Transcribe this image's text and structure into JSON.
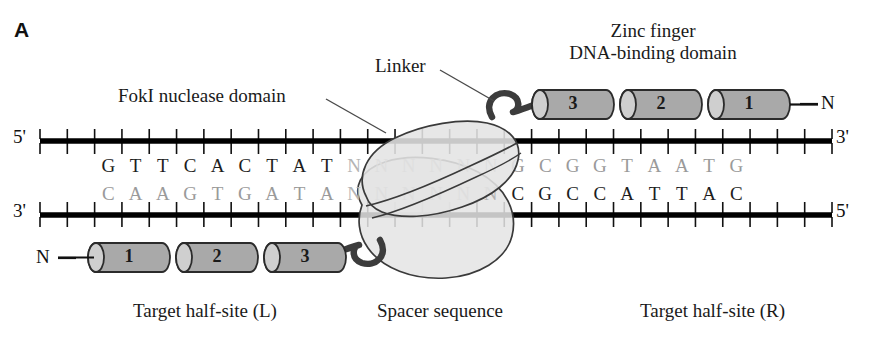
{
  "panel": {
    "label": "A"
  },
  "labels": {
    "fok_nuclease": "FokI nuclease domain",
    "linker": "Linker",
    "zinc_finger_line1": "Zinc finger",
    "zinc_finger_line2": "DNA-binding domain",
    "target_half_site_left": "Target half-site (L)",
    "spacer_sequence": "Spacer sequence",
    "target_half_site_right": "Target half-site (R)"
  },
  "dna": {
    "top_strand_five_prime": "5'",
    "top_strand_three_prime": "3'",
    "bottom_strand_three_prime": "3'",
    "bottom_strand_five_prime": "5'",
    "left_half_site": {
      "top_bases": [
        "G",
        "T",
        "T",
        "C",
        "A",
        "C",
        "T",
        "A",
        "T"
      ],
      "bottom_bases": [
        "C",
        "A",
        "A",
        "G",
        "T",
        "G",
        "A",
        "T",
        "A"
      ]
    },
    "spacer": {
      "top_bases": [
        "N",
        "N",
        "N",
        "N",
        "N",
        "N"
      ],
      "bottom_bases": [
        "N",
        "N",
        "N",
        "N",
        "N",
        "N"
      ]
    },
    "right_half_site": {
      "top_bases": [
        "G",
        "C",
        "G",
        "G",
        "T",
        "A",
        "A",
        "T",
        "G"
      ],
      "bottom_bases": [
        "C",
        "G",
        "C",
        "C",
        "A",
        "T",
        "T",
        "A",
        "C"
      ]
    }
  },
  "zinc_finger_top": {
    "terminus": "N",
    "fingers": [
      "3",
      "2",
      "1"
    ]
  },
  "zinc_finger_bottom": {
    "terminus": "N",
    "fingers": [
      "1",
      "2",
      "3"
    ]
  },
  "colors": {
    "dna_backbone": "#000000",
    "cylinder_fill": "#a9a9a9",
    "cylinder_cap": "#cfcfcf",
    "cylinder_stroke": "#2b2b2b",
    "nuclease_fill": "#e4e4e4",
    "nuclease_stroke": "#3a3a3a",
    "linker_stroke": "#3c3c3c",
    "base_dark": "#1d1d1d",
    "base_light": "#9a9a9a",
    "leader_line": "#4a4a4a"
  }
}
